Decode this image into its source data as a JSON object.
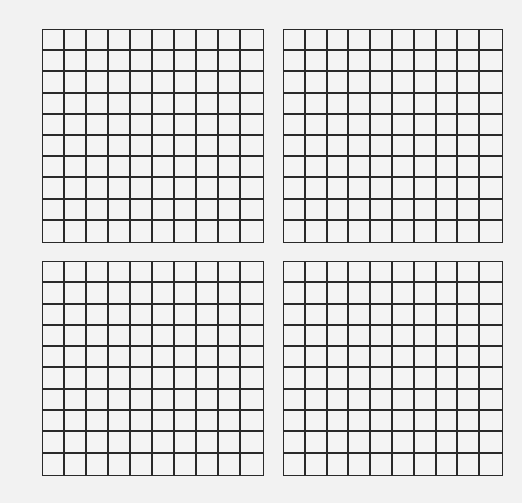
{
  "diagram": {
    "colors": {
      "line": "#2a2a2a",
      "background": "#f2f2f2"
    },
    "grids": [
      {
        "id": "top-left",
        "rows": 10,
        "cols": 10,
        "x": 42,
        "y": 29,
        "width": 222,
        "height": 214
      },
      {
        "id": "top-right",
        "rows": 10,
        "cols": 10,
        "x": 283,
        "y": 29,
        "width": 220,
        "height": 214
      },
      {
        "id": "bottom-left",
        "rows": 10,
        "cols": 10,
        "x": 42,
        "y": 261,
        "width": 222,
        "height": 215
      },
      {
        "id": "bottom-right",
        "rows": 10,
        "cols": 10,
        "x": 283,
        "y": 261,
        "width": 220,
        "height": 215
      }
    ]
  }
}
